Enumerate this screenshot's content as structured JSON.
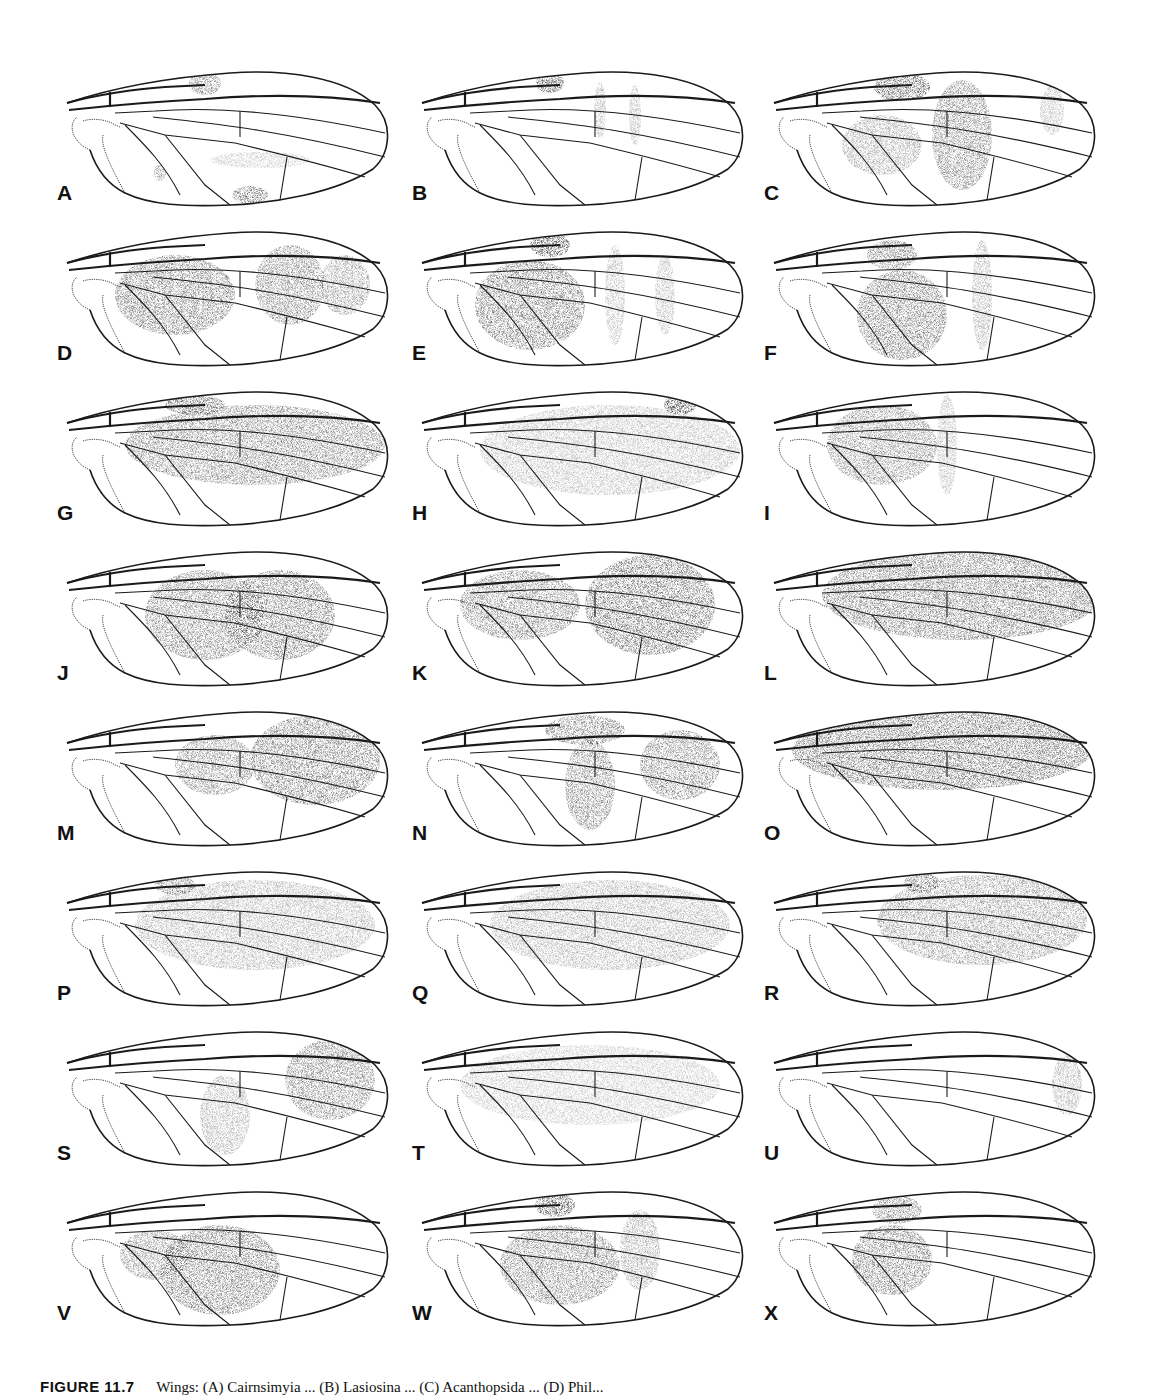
{
  "figure": {
    "number": "FIGURE 11.7",
    "caption": "Wings: (A) Cairnsimyia ... (B) Lasiosina ... (C) Acanthopsida ... (D) Phil...",
    "panels": [
      {
        "label": "A",
        "shading": [
          {
            "x": 150,
            "y": 18,
            "rx": 16,
            "ry": 12,
            "o": 0.55
          },
          {
            "x": 205,
            "y": 95,
            "rx": 50,
            "ry": 8,
            "o": 0.25
          },
          {
            "x": 195,
            "y": 130,
            "rx": 18,
            "ry": 9,
            "o": 0.7
          },
          {
            "x": 105,
            "y": 108,
            "rx": 6,
            "ry": 8,
            "o": 0.5
          }
        ]
      },
      {
        "label": "B",
        "shading": [
          {
            "x": 140,
            "y": 18,
            "rx": 14,
            "ry": 10,
            "o": 0.8
          },
          {
            "x": 190,
            "y": 45,
            "rx": 6,
            "ry": 28,
            "o": 0.35
          },
          {
            "x": 225,
            "y": 50,
            "rx": 6,
            "ry": 30,
            "o": 0.35
          }
        ]
      },
      {
        "label": "C",
        "shading": [
          {
            "x": 140,
            "y": 22,
            "rx": 28,
            "ry": 14,
            "o": 0.75
          },
          {
            "x": 200,
            "y": 70,
            "rx": 30,
            "ry": 55,
            "o": 0.55
          },
          {
            "x": 120,
            "y": 80,
            "rx": 40,
            "ry": 30,
            "o": 0.4
          },
          {
            "x": 290,
            "y": 45,
            "rx": 12,
            "ry": 25,
            "o": 0.3
          }
        ]
      },
      {
        "label": "D",
        "shading": [
          {
            "x": 120,
            "y": 70,
            "rx": 60,
            "ry": 40,
            "o": 0.6
          },
          {
            "x": 235,
            "y": 60,
            "rx": 35,
            "ry": 40,
            "o": 0.55
          },
          {
            "x": 290,
            "y": 60,
            "rx": 25,
            "ry": 30,
            "o": 0.45
          }
        ]
      },
      {
        "label": "E",
        "shading": [
          {
            "x": 140,
            "y": 20,
            "rx": 20,
            "ry": 12,
            "o": 0.8
          },
          {
            "x": 120,
            "y": 80,
            "rx": 55,
            "ry": 45,
            "o": 0.6
          },
          {
            "x": 205,
            "y": 70,
            "rx": 10,
            "ry": 50,
            "o": 0.3
          },
          {
            "x": 255,
            "y": 70,
            "rx": 10,
            "ry": 40,
            "o": 0.3
          }
        ]
      },
      {
        "label": "F",
        "shading": [
          {
            "x": 130,
            "y": 30,
            "rx": 25,
            "ry": 15,
            "o": 0.6
          },
          {
            "x": 140,
            "y": 90,
            "rx": 45,
            "ry": 45,
            "o": 0.6
          },
          {
            "x": 220,
            "y": 70,
            "rx": 10,
            "ry": 55,
            "o": 0.35
          }
        ]
      },
      {
        "label": "G",
        "shading": [
          {
            "x": 200,
            "y": 60,
            "rx": 130,
            "ry": 40,
            "o": 0.55
          },
          {
            "x": 140,
            "y": 20,
            "rx": 30,
            "ry": 10,
            "o": 0.7
          }
        ]
      },
      {
        "label": "H",
        "shading": [
          {
            "x": 200,
            "y": 65,
            "rx": 130,
            "ry": 45,
            "o": 0.3
          },
          {
            "x": 270,
            "y": 20,
            "rx": 16,
            "ry": 10,
            "o": 0.85
          }
        ]
      },
      {
        "label": "I",
        "shading": [
          {
            "x": 120,
            "y": 60,
            "rx": 55,
            "ry": 40,
            "o": 0.5
          },
          {
            "x": 185,
            "y": 60,
            "rx": 10,
            "ry": 50,
            "o": 0.3
          }
        ]
      },
      {
        "label": "J",
        "shading": [
          {
            "x": 150,
            "y": 70,
            "rx": 60,
            "ry": 45,
            "o": 0.55
          },
          {
            "x": 225,
            "y": 70,
            "rx": 55,
            "ry": 45,
            "o": 0.6
          }
        ]
      },
      {
        "label": "K",
        "shading": [
          {
            "x": 110,
            "y": 60,
            "rx": 60,
            "ry": 35,
            "o": 0.55
          },
          {
            "x": 240,
            "y": 60,
            "rx": 65,
            "ry": 50,
            "o": 0.65
          }
        ]
      },
      {
        "label": "L",
        "shading": [
          {
            "x": 200,
            "y": 50,
            "rx": 140,
            "ry": 45,
            "o": 0.6
          }
        ]
      },
      {
        "label": "M",
        "shading": [
          {
            "x": 260,
            "y": 55,
            "rx": 65,
            "ry": 45,
            "o": 0.6
          },
          {
            "x": 160,
            "y": 60,
            "rx": 40,
            "ry": 30,
            "o": 0.5
          }
        ]
      },
      {
        "label": "N",
        "shading": [
          {
            "x": 175,
            "y": 25,
            "rx": 40,
            "ry": 15,
            "o": 0.6
          },
          {
            "x": 180,
            "y": 80,
            "rx": 25,
            "ry": 45,
            "o": 0.55
          },
          {
            "x": 270,
            "y": 60,
            "rx": 40,
            "ry": 35,
            "o": 0.55
          }
        ]
      },
      {
        "label": "O",
        "shading": [
          {
            "x": 180,
            "y": 45,
            "rx": 150,
            "ry": 40,
            "o": 0.65
          }
        ]
      },
      {
        "label": "P",
        "shading": [
          {
            "x": 200,
            "y": 60,
            "rx": 120,
            "ry": 45,
            "o": 0.35
          },
          {
            "x": 120,
            "y": 20,
            "rx": 20,
            "ry": 10,
            "o": 0.55
          }
        ]
      },
      {
        "label": "Q",
        "shading": [
          {
            "x": 200,
            "y": 60,
            "rx": 120,
            "ry": 45,
            "o": 0.35
          }
        ]
      },
      {
        "label": "R",
        "shading": [
          {
            "x": 220,
            "y": 55,
            "rx": 105,
            "ry": 45,
            "o": 0.45
          },
          {
            "x": 160,
            "y": 18,
            "rx": 18,
            "ry": 10,
            "o": 0.6
          }
        ]
      },
      {
        "label": "S",
        "shading": [
          {
            "x": 275,
            "y": 55,
            "rx": 45,
            "ry": 40,
            "o": 0.55
          },
          {
            "x": 170,
            "y": 90,
            "rx": 25,
            "ry": 40,
            "o": 0.35
          }
        ]
      },
      {
        "label": "T",
        "shading": [
          {
            "x": 180,
            "y": 60,
            "rx": 130,
            "ry": 40,
            "o": 0.25
          }
        ]
      },
      {
        "label": "U",
        "shading": [
          {
            "x": 305,
            "y": 60,
            "rx": 15,
            "ry": 30,
            "o": 0.35
          }
        ]
      },
      {
        "label": "V",
        "shading": [
          {
            "x": 165,
            "y": 85,
            "rx": 60,
            "ry": 45,
            "o": 0.6
          },
          {
            "x": 100,
            "y": 70,
            "rx": 35,
            "ry": 25,
            "o": 0.5
          }
        ]
      },
      {
        "label": "W",
        "shading": [
          {
            "x": 145,
            "y": 20,
            "rx": 20,
            "ry": 12,
            "o": 0.8
          },
          {
            "x": 150,
            "y": 80,
            "rx": 60,
            "ry": 40,
            "o": 0.55
          },
          {
            "x": 230,
            "y": 65,
            "rx": 20,
            "ry": 40,
            "o": 0.4
          }
        ]
      },
      {
        "label": "X",
        "shading": [
          {
            "x": 135,
            "y": 25,
            "rx": 25,
            "ry": 14,
            "o": 0.55
          },
          {
            "x": 130,
            "y": 75,
            "rx": 40,
            "ry": 35,
            "o": 0.6
          }
        ]
      }
    ]
  },
  "layout": {
    "columns_x": [
      55,
      410,
      762
    ],
    "rows_y": [
      65,
      225,
      385,
      545,
      705,
      865,
      1025,
      1185
    ]
  }
}
